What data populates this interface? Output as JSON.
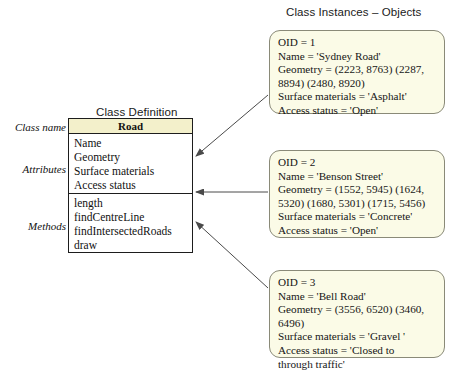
{
  "titles": {
    "class_definition": "Class Definition",
    "class_instances": "Class Instances – Objects"
  },
  "side_labels": {
    "class_name": "Class name",
    "attributes": "Attributes",
    "methods": "Methods"
  },
  "class_definition": {
    "name": "Road",
    "attributes": [
      "Name",
      "Geometry",
      "Surface materials",
      "Access status"
    ],
    "methods": [
      "length",
      "findCentreLine",
      "findIntersectedRoads",
      "draw"
    ]
  },
  "instances": [
    {
      "lines": [
        "OID = 1",
        "Name = 'Sydney Road'",
        "Geometry =  (2223, 8763) (2287,",
        "8894) (2480, 8920)",
        "Surface materials = 'Asphalt'",
        "Access status =  'Open'"
      ]
    },
    {
      "lines": [
        "OID = 2",
        "Name = 'Benson Street'",
        "Geometry  =  (1552, 5945) (1624,",
        "5320) (1680, 5301) (1715, 5456)",
        "Surface materials = 'Concrete'",
        "Access status =  'Open'"
      ]
    },
    {
      "lines": [
        "OID = 3",
        "Name = 'Bell Road'",
        "Geometry  =  (3556, 6520) (3460,",
        "6496)",
        "Surface materials = 'Gravel '",
        "Access status =  'Closed to",
        "through traffic'"
      ]
    }
  ],
  "colors": {
    "box_fill": "#fbfbe7",
    "header_fill": "#f3f0cb",
    "border": "#1d1d1d",
    "obj_border": "#8a8a78",
    "connector": "#4a4a4a"
  }
}
